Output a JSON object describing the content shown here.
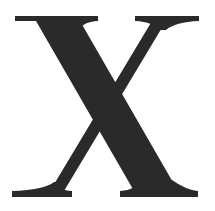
{
  "glyph": {
    "character": "X",
    "style": "serif",
    "color": "#2a2a2a",
    "background": "#ffffff"
  }
}
